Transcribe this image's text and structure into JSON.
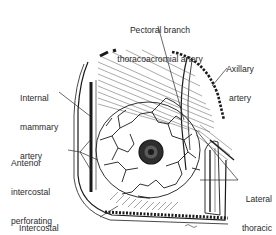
{
  "figure": {
    "labels": {
      "pectoral_branch": [
        "Pectoral branch",
        "thoracoacromial artery"
      ],
      "axillary": [
        "Axillary",
        "artery"
      ],
      "internal_mammary": [
        "Internal",
        "mammary",
        "artery"
      ],
      "anterior_intercostal": [
        "Anterior",
        "intercostal",
        "perforating",
        "arteries"
      ],
      "lateral_thoracic": [
        "Lateral",
        "thoracic",
        "artery"
      ],
      "intercostal_branches": [
        "Intercostal",
        "branches of arteries"
      ]
    },
    "colors": {
      "ink": "#1a1a1a",
      "paper": "#ffffff",
      "label": "#2a2a2a"
    }
  }
}
